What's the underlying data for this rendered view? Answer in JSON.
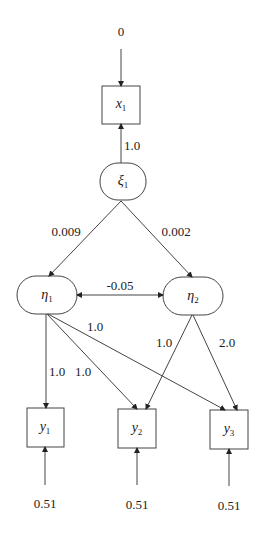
{
  "diagram": {
    "type": "path-diagram (structural equation model)",
    "nodes": {
      "x1": {
        "label": "x",
        "sub": "1",
        "shape": "rectangle"
      },
      "xi1": {
        "label": "ξ",
        "sub": "1",
        "shape": "rounded"
      },
      "eta1": {
        "label": "η",
        "sub": "1",
        "shape": "rounded"
      },
      "eta2": {
        "label": "η",
        "sub": "2",
        "shape": "rounded"
      },
      "y1": {
        "label": "y",
        "sub": "1",
        "shape": "rectangle"
      },
      "y2": {
        "label": "y",
        "sub": "2",
        "shape": "rectangle"
      },
      "y3": {
        "label": "y",
        "sub": "3",
        "shape": "rectangle"
      }
    },
    "edges": {
      "err_x1": {
        "from": "0",
        "to": "x1",
        "label": "0"
      },
      "xi1_x1": {
        "from": "xi1",
        "to": "x1",
        "label": "1.0"
      },
      "xi1_eta1": {
        "from": "xi1",
        "to": "eta1",
        "label": "0.009"
      },
      "xi1_eta2": {
        "from": "xi1",
        "to": "eta2",
        "label": "0.002"
      },
      "eta1_eta2": {
        "from": "eta1",
        "to": "eta2",
        "label": "-0.05",
        "bidirectional": true
      },
      "eta1_y1": {
        "from": "eta1",
        "to": "y1",
        "label": "1.0"
      },
      "eta1_y2": {
        "from": "eta1",
        "to": "y2",
        "label": "1.0"
      },
      "eta1_y3": {
        "from": "eta1",
        "to": "y3",
        "label": "1.0"
      },
      "eta2_y2": {
        "from": "eta2",
        "to": "y2",
        "label": "1.0"
      },
      "eta2_y3": {
        "from": "eta2",
        "to": "y3",
        "label": "2.0"
      },
      "err_y1": {
        "to": "y1",
        "label": "0.51"
      },
      "err_y2": {
        "to": "y2",
        "label": "0.51"
      },
      "err_y3": {
        "to": "y3",
        "label": "0.51"
      }
    }
  }
}
